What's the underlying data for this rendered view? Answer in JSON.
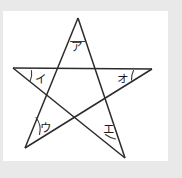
{
  "figure": {
    "background_color": "#e9e9e9",
    "paper_color": "#ffffff",
    "stroke_color": "#2b2b2b",
    "label_color": "#1a1a1a",
    "shape": "five-pointed star (pentagram)",
    "vertices": [
      {
        "id": "top",
        "x": 78,
        "y": 18
      },
      {
        "id": "right",
        "x": 152,
        "y": 69
      },
      {
        "id": "bottom-right",
        "x": 125,
        "y": 158
      },
      {
        "id": "bottom-left",
        "x": 25,
        "y": 148
      },
      {
        "id": "left",
        "x": 13,
        "y": 68
      }
    ],
    "lines": [
      {
        "id": "line-1",
        "from": "top",
        "to": "bottom-right"
      },
      {
        "id": "line-2",
        "from": "bottom-right",
        "to": "left"
      },
      {
        "id": "line-3",
        "from": "left",
        "to": "right"
      },
      {
        "id": "line-4",
        "from": "right",
        "to": "bottom-left"
      },
      {
        "id": "line-5",
        "from": "bottom-left",
        "to": "top"
      }
    ],
    "angle_labels": [
      {
        "id": "label-a",
        "text": "ア",
        "vertex": "top",
        "x": 76,
        "y": 47
      },
      {
        "id": "label-i",
        "text": "イ",
        "vertex": "left",
        "x": 40,
        "y": 79
      },
      {
        "id": "label-u",
        "text": "ウ",
        "vertex": "bottom-left",
        "x": 45,
        "y": 128
      },
      {
        "id": "label-e",
        "text": "エ",
        "vertex": "bottom-right",
        "x": 108,
        "y": 129
      },
      {
        "id": "label-o",
        "text": "オ",
        "vertex": "right",
        "x": 122,
        "y": 79
      }
    ],
    "angle_arcs": [
      {
        "id": "arc-a",
        "vertex": "top",
        "path": "M 70.5 41.5 L 85.5 41.5"
      },
      {
        "id": "arc-i",
        "vertex": "left",
        "path": "M 31.5 70.5 A 19 19 0 0 1 30.0 81.5"
      },
      {
        "id": "arc-u",
        "vertex": "bottom-left",
        "path": "M 36.0 117.5 A 20 20 0 0 1 39.5 134.5"
      },
      {
        "id": "arc-e",
        "vertex": "bottom-right",
        "path": "M 105.5 134.5 A 22 22 0 0 0 115.5 139.0"
      },
      {
        "id": "arc-o",
        "vertex": "right",
        "path": "M 133.5 70.5 A 20 20 0 0 0 131.5 80.0"
      }
    ]
  }
}
